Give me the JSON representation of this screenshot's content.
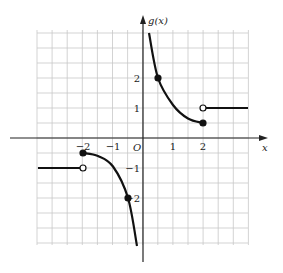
{
  "chart_data": {
    "type": "line",
    "title": "",
    "xlabel": "x",
    "ylabel": "g(x)",
    "origin_label": "O",
    "x_ticks": [
      {
        "v": -2,
        "label": "−2"
      },
      {
        "v": -1,
        "label": "−1"
      },
      {
        "v": 1,
        "label": "1"
      },
      {
        "v": 2,
        "label": "2"
      }
    ],
    "y_ticks": [
      {
        "v": 2,
        "label": "2"
      },
      {
        "v": 1,
        "label": "1"
      },
      {
        "v": -1,
        "label": "−1"
      },
      {
        "v": -2,
        "label": "−2"
      }
    ],
    "grid": true,
    "grid_step": 0.5,
    "xlim": [
      -3.5,
      3.5
    ],
    "ylim": [
      -3.6,
      3.6
    ],
    "segments": [
      {
        "name": "left-constant",
        "points": [
          [
            -3.5,
            -1
          ],
          [
            -2,
            -1
          ]
        ],
        "end": "open"
      },
      {
        "name": "left-curve",
        "points": [
          [
            -2,
            -0.5
          ],
          [
            -1.5,
            -0.6
          ],
          [
            -1,
            -0.95
          ],
          [
            -0.5,
            -2
          ],
          [
            -0.2,
            -3.6
          ]
        ],
        "start": "closed"
      },
      {
        "name": "right-curve",
        "points": [
          [
            0.2,
            3.5
          ],
          [
            0.5,
            2
          ],
          [
            1,
            1.1
          ],
          [
            1.5,
            0.65
          ],
          [
            2,
            0.5
          ]
        ],
        "end": "closed"
      },
      {
        "name": "right-constant",
        "points": [
          [
            2,
            1
          ],
          [
            3.5,
            1
          ]
        ],
        "start": "open"
      }
    ],
    "marked_points": [
      {
        "x": -2,
        "y": -0.5,
        "type": "closed"
      },
      {
        "x": -2,
        "y": -1,
        "type": "open"
      },
      {
        "x": -0.5,
        "y": -2,
        "type": "closed"
      },
      {
        "x": 0.5,
        "y": 2,
        "type": "closed"
      },
      {
        "x": 2,
        "y": 0.5,
        "type": "closed"
      },
      {
        "x": 2,
        "y": 1,
        "type": "open"
      }
    ]
  }
}
